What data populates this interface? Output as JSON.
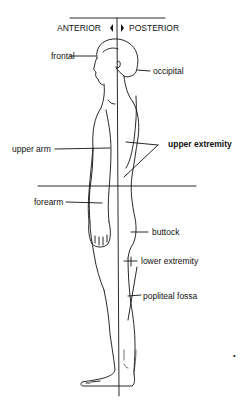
{
  "diagram": {
    "planes": {
      "anterior": "ANTERIOR",
      "posterior": "POSTERIOR"
    },
    "labels": {
      "frontal": "frontal",
      "occipital": "occipital",
      "upper_arm": "upper arm",
      "upper_extremity": "upper extremity",
      "forearm": "forearm",
      "buttock": "buttock",
      "lower_extremity": "lower extremity",
      "popliteal_fossa": "popliteal fossa"
    },
    "marker": "•",
    "colors": {
      "line": "#111111",
      "background": "#ffffff"
    }
  }
}
